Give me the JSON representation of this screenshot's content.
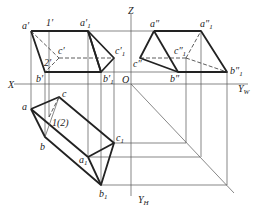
{
  "figure": {
    "axes": {
      "X": "X",
      "Z": "Z",
      "O": "O",
      "Y_W": "Y",
      "Y_W_sub": "W",
      "Y_H": "Y",
      "Y_H_sub": "H"
    },
    "front_view_labels": {
      "a": "a′",
      "one": "1′",
      "a1": "a′",
      "a1_sub": "1",
      "c": "c′",
      "two": "2′",
      "c1": "c′",
      "c1_sub": "1",
      "b": "b′",
      "b1": "b′",
      "b1_sub": "1"
    },
    "side_view_labels": {
      "a": "a″",
      "a1": "a″",
      "a1_sub": "1",
      "c": "c″",
      "c1": "c″",
      "c1_sub": "1",
      "b": "b″",
      "b1": "b″",
      "b1_sub": "1"
    },
    "top_view_labels": {
      "a": "a",
      "c": "c",
      "b": "b",
      "one_two": "1(2)",
      "c1": "c",
      "c1_sub": "1",
      "a1": "a",
      "a1_sub": "1",
      "b1": "b",
      "b1_sub": "1"
    }
  }
}
